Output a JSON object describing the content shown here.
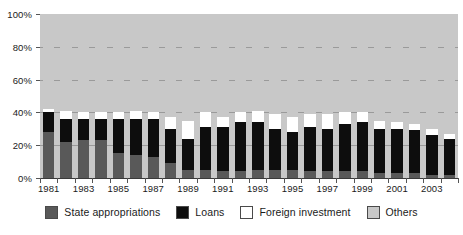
{
  "chart_data": {
    "type": "bar",
    "stacked": true,
    "normalized": "100%",
    "title": "",
    "subtitle": "",
    "xlabel": "",
    "ylabel": "",
    "ylim": [
      0,
      100
    ],
    "yticks": [
      "0%",
      "20%",
      "40%",
      "60%",
      "80%",
      "100%"
    ],
    "ytick_values": [
      0,
      20,
      40,
      60,
      80,
      100
    ],
    "grid": true,
    "legend_position": "bottom",
    "categories": [
      "1981",
      "1982",
      "1983",
      "1984",
      "1985",
      "1986",
      "1987",
      "1988",
      "1989",
      "1990",
      "1991",
      "1992",
      "1993",
      "1994",
      "1995",
      "1996",
      "1997",
      "1998",
      "1999",
      "2000",
      "2001",
      "2002",
      "2003",
      "2004"
    ],
    "xtick_labels": [
      "1981",
      "1983",
      "1985",
      "1987",
      "1989",
      "1991",
      "1993",
      "1995",
      "1997",
      "1999",
      "2001",
      "2003"
    ],
    "series": [
      {
        "name": "State appropriations",
        "color": "#595959",
        "values": [
          28,
          22,
          23,
          23,
          15,
          14,
          13,
          9,
          5,
          5,
          4,
          4,
          5,
          5,
          5,
          4,
          4,
          4,
          4,
          3,
          3,
          3,
          2,
          2
        ]
      },
      {
        "name": "Loans",
        "color": "#0d0d0d",
        "values": [
          12,
          14,
          13,
          13,
          21,
          22,
          23,
          21,
          19,
          26,
          27,
          30,
          29,
          25,
          23,
          27,
          26,
          29,
          30,
          27,
          27,
          26,
          24,
          22
        ]
      },
      {
        "name": "Foreign investment",
        "color": "#ffffff",
        "values": [
          2,
          5,
          4,
          4,
          4,
          5,
          4,
          7,
          11,
          9,
          6,
          6,
          7,
          9,
          9,
          8,
          9,
          7,
          6,
          5,
          4,
          4,
          4,
          3
        ]
      },
      {
        "name": "Others",
        "color": "#c8c8c8",
        "values": [
          58,
          59,
          60,
          60,
          60,
          59,
          60,
          63,
          65,
          60,
          63,
          60,
          59,
          61,
          63,
          61,
          61,
          60,
          60,
          65,
          66,
          67,
          70,
          73
        ]
      }
    ]
  },
  "legend": {
    "items": [
      {
        "label": "State appropriations",
        "swatch": "state"
      },
      {
        "label": "Loans",
        "swatch": "loans"
      },
      {
        "label": "Foreign investment",
        "swatch": "foreign"
      },
      {
        "label": "Others",
        "swatch": "others"
      }
    ]
  }
}
